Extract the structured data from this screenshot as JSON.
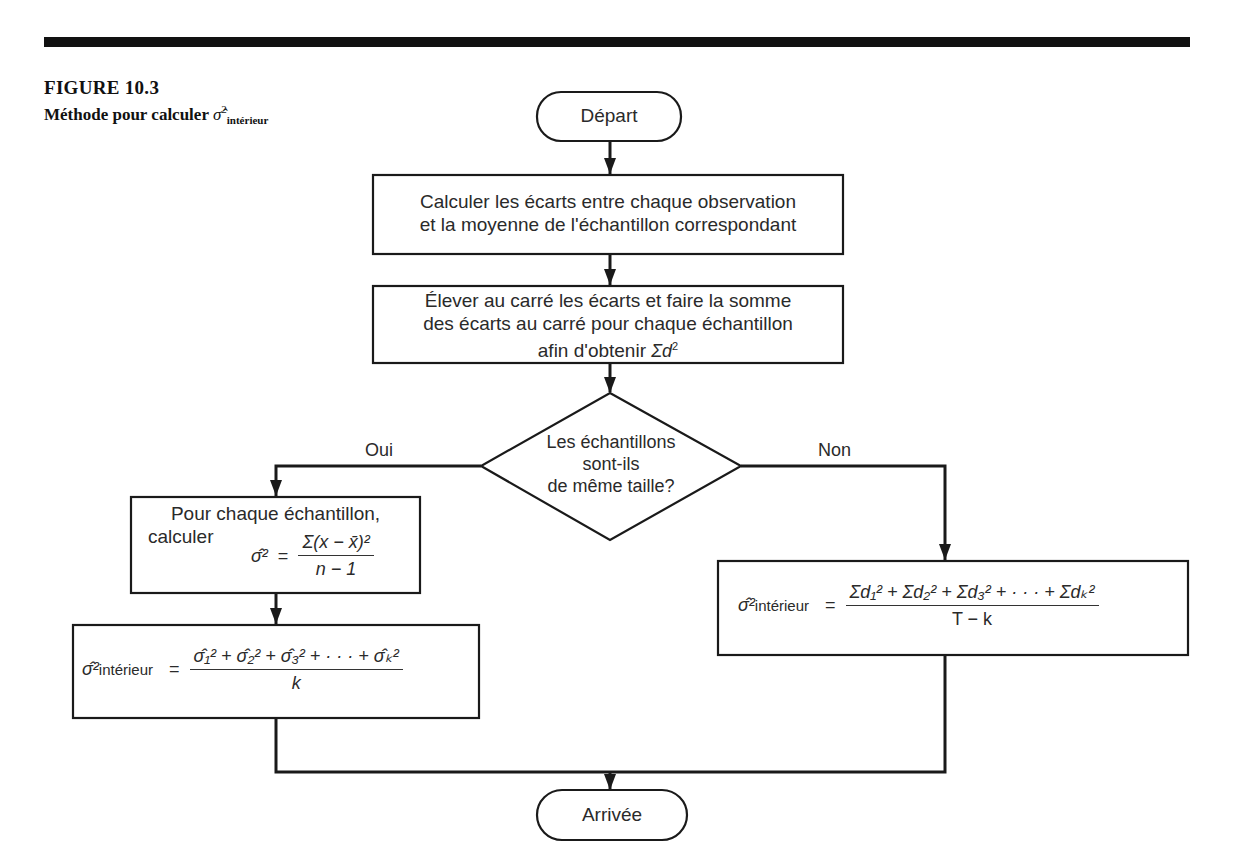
{
  "figure": {
    "number": "FIGURE 10.3",
    "title_prefix": "Méthode pour calculer",
    "title_symbol": "σ̂",
    "title_sup": "2",
    "title_sub": "intérieur"
  },
  "flowchart": {
    "start": {
      "label": "Départ"
    },
    "step1": {
      "lines": [
        "Calculer les écarts entre chaque observation",
        "et la moyenne de l'échantillon correspondant"
      ]
    },
    "step2": {
      "lines": [
        "Élever au carré les écarts et faire la somme",
        "des écarts au carré pour chaque échantillon"
      ],
      "last_line_prefix": "afin d'obtenir",
      "last_line_math": "Σd",
      "last_line_sup": "2"
    },
    "decision": {
      "lines": [
        "Les échantillons",
        "sont-ils",
        "de même taille?"
      ]
    },
    "branch_yes": {
      "label": "Oui"
    },
    "branch_no": {
      "label": "Non"
    },
    "yes_step1": {
      "line1": "Pour chaque échantillon,",
      "line2": "calculer",
      "lhs": "σ̂²",
      "equals": "=",
      "numerator": "Σ(x − x̄)²",
      "denominator": "n − 1"
    },
    "yes_step2": {
      "lhs_symbol": "σ̂²",
      "lhs_sub": "intérieur",
      "equals": "=",
      "numerator": "σ̂₁² + σ̂₂² + σ̂₃² + · · · + σ̂ₖ²",
      "denominator": "k"
    },
    "no_step": {
      "lhs_symbol": "σ̂²",
      "lhs_sub": "intérieur",
      "equals": "=",
      "numerator": "Σd₁² + Σd₂² + Σd₃² + · · · + Σdₖ²",
      "denominator": "T − k"
    },
    "end": {
      "label": "Arrivée"
    }
  },
  "colors": {
    "line": "#1a1a1a",
    "text": "#2a2a2a",
    "background": "#ffffff"
  }
}
